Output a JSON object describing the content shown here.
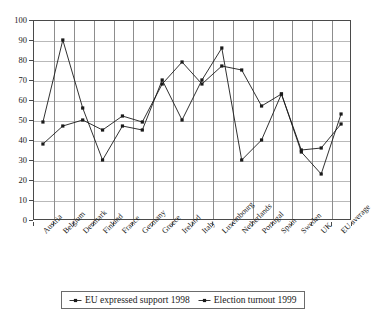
{
  "chart_data": {
    "type": "line",
    "title": "",
    "xlabel": "",
    "ylabel": "",
    "ylim": [
      0,
      100
    ],
    "ytick_step": 10,
    "yticks": [
      0,
      10,
      20,
      30,
      40,
      50,
      60,
      70,
      80,
      90,
      100
    ],
    "grid": "both",
    "legend_position": "bottom",
    "categories": [
      "Austria",
      "Belgium",
      "Denmark",
      "Finland",
      "France",
      "Germany",
      "Greece",
      "Ireland",
      "Italy",
      "Luxembourg",
      "Netherlands",
      "Portugal",
      "Spain",
      "Sweden",
      "UK",
      "EU average"
    ],
    "series": [
      {
        "name": "EU expressed support 1998",
        "marker": "dot-line",
        "color": "#1a1a1a",
        "values": [
          38,
          47,
          50,
          45,
          52,
          49,
          68,
          79,
          68,
          77,
          75,
          57,
          63,
          35,
          36,
          48
        ]
      },
      {
        "name": "Election turnout 1999",
        "marker": "dot-line",
        "color": "#1a1a1a",
        "values": [
          49,
          90,
          56,
          30,
          47,
          45,
          70,
          50,
          70,
          86,
          30,
          40,
          63,
          34,
          23,
          53
        ]
      }
    ]
  },
  "legend": {
    "entries": [
      "EU expressed support 1998",
      "Election turnout 1999"
    ]
  }
}
